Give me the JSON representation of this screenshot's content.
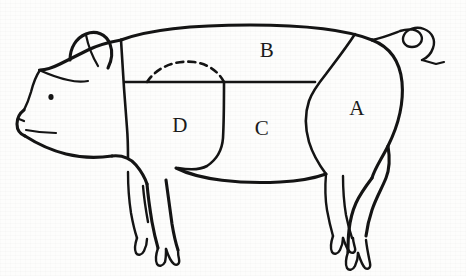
{
  "figure": {
    "type": "line-drawing",
    "background_color": "#fdfdfc",
    "ink_color": "#141414"
  },
  "cut_labels": [
    {
      "id": "A",
      "text": "A",
      "x": 357,
      "y": 110
    },
    {
      "id": "B",
      "text": "B",
      "x": 267,
      "y": 52
    },
    {
      "id": "C",
      "text": "C",
      "x": 262,
      "y": 130
    },
    {
      "id": "D",
      "text": "D",
      "x": 180,
      "y": 127
    }
  ],
  "regions": {
    "a_label": "A",
    "b_label": "B",
    "c_label": "C",
    "d_label": "D"
  },
  "anatomy": {
    "ear": "ear",
    "eye": "eye",
    "snout": "snout",
    "tail": "curly-tail",
    "front_legs": 2,
    "hind_legs": 2,
    "hoof_type": "cloven"
  },
  "division_lines": {
    "shoulder_vertical": "solid",
    "mid_horizontal": "solid",
    "belly_vertical": "solid",
    "ham_curve": "solid",
    "shoulder_blade_arc": "dashed"
  }
}
